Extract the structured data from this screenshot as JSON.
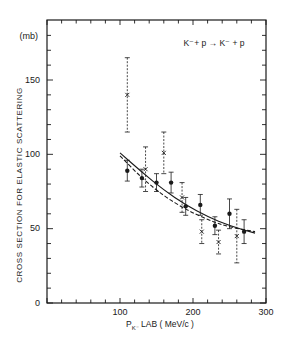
{
  "chart_data": {
    "type": "scatter",
    "xlabel": "P_K- LAB (MeV/c)",
    "ylabel": "CROSS SECTION FOR ELASTIC SCATTERING",
    "yunit": "(mb)",
    "xlim": [
      0,
      300
    ],
    "ylim": [
      0,
      175
    ],
    "xticks": [
      0,
      100,
      200,
      300
    ],
    "yticks": [
      0,
      50,
      100,
      150
    ],
    "grid": false,
    "series": [
      {
        "name": "filled dots (solid error bars)",
        "marker": "dot",
        "points": [
          {
            "x": 110,
            "y": 89,
            "err": 7
          },
          {
            "x": 130,
            "y": 84,
            "err": 6
          },
          {
            "x": 150,
            "y": 81,
            "err": 6
          },
          {
            "x": 170,
            "y": 81,
            "err": 7
          },
          {
            "x": 190,
            "y": 65,
            "err": 6
          },
          {
            "x": 210,
            "y": 66,
            "err": 7
          },
          {
            "x": 230,
            "y": 52,
            "err": 6
          },
          {
            "x": 250,
            "y": 60,
            "err": 10
          },
          {
            "x": 270,
            "y": 48,
            "err": 8
          }
        ]
      },
      {
        "name": "crosses (dashed error bars)",
        "marker": "cross",
        "points": [
          {
            "x": 110,
            "y": 140,
            "err": 25
          },
          {
            "x": 135,
            "y": 90,
            "err": 15
          },
          {
            "x": 160,
            "y": 101,
            "err": 14
          },
          {
            "x": 185,
            "y": 71,
            "err": 10
          },
          {
            "x": 212,
            "y": 48,
            "err": 8
          },
          {
            "x": 235,
            "y": 41,
            "err": 8
          },
          {
            "x": 260,
            "y": 45,
            "err": 18
          }
        ]
      },
      {
        "name": "fit (solid curve)",
        "style": "solid",
        "curve": [
          [
            100,
            101
          ],
          [
            130,
            88
          ],
          [
            160,
            76
          ],
          [
            190,
            66
          ],
          [
            220,
            58
          ],
          [
            250,
            52
          ],
          [
            285,
            47
          ]
        ]
      },
      {
        "name": "fit (dashed curve)",
        "style": "dashed",
        "curve": [
          [
            100,
            99
          ],
          [
            130,
            84
          ],
          [
            160,
            72
          ],
          [
            190,
            63
          ],
          [
            220,
            56
          ],
          [
            250,
            51
          ],
          [
            285,
            48
          ]
        ]
      }
    ]
  },
  "labels": {
    "reaction": "K⁻+ p  →  K⁻ + p",
    "unit": "(mb)",
    "ylabel": "CROSS SECTION FOR ELASTIC SCATTERING",
    "xlabel_main": "P",
    "xlabel_sub": "K⁻",
    "xlabel_rest": " LAB  ( MeV/c )",
    "ytick_labels": [
      "0",
      "50",
      "100",
      "150"
    ],
    "xtick_labels": [
      "100",
      "200",
      "300"
    ]
  }
}
